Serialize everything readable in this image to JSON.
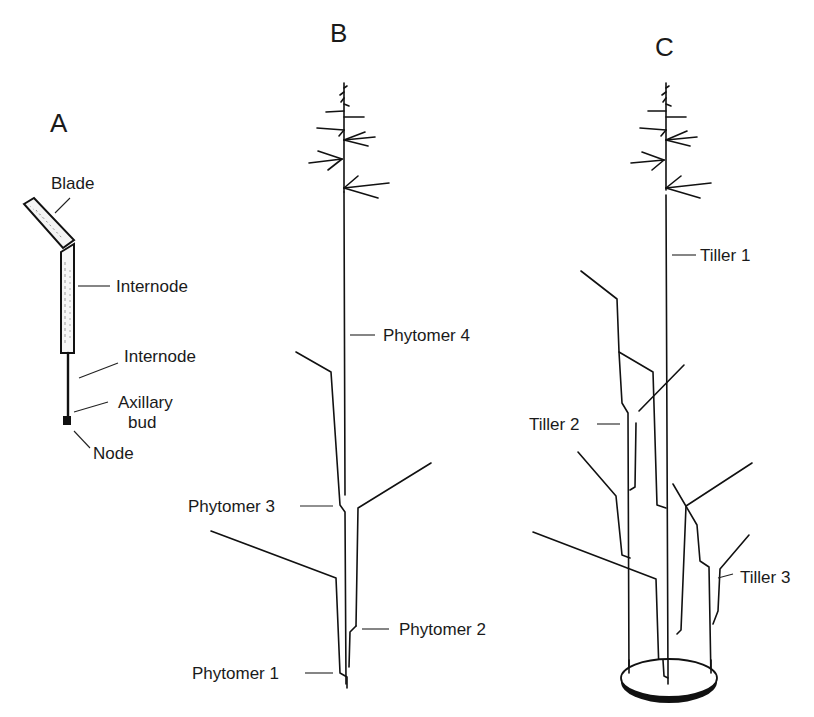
{
  "figure": {
    "panels": {
      "A": {
        "title": "A",
        "labels": {
          "blade": "Blade",
          "internode_upper": "Internode",
          "internode_lower": "Internode",
          "axillary_bud_line1": "Axillary",
          "axillary_bud_line2": "bud",
          "node": "Node"
        }
      },
      "B": {
        "title": "B",
        "labels": {
          "phytomer4": "Phytomer 4",
          "phytomer3": "Phytomer 3",
          "phytomer2": "Phytomer 2",
          "phytomer1": "Phytomer 1"
        }
      },
      "C": {
        "title": "C",
        "labels": {
          "tiller1": "Tiller 1",
          "tiller2": "Tiller 2",
          "tiller3": "Tiller 3"
        }
      }
    },
    "colors": {
      "ink": "#111111",
      "background": "#ffffff"
    }
  }
}
